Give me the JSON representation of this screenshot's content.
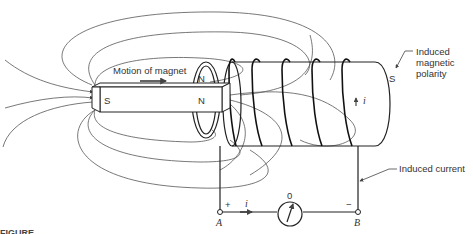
{
  "diagram": {
    "magnet": {
      "motion_label": "Motion of magnet",
      "south_pole": "S",
      "north_pole": "N"
    },
    "coil": {
      "near_end_pole": "N",
      "far_end_pole": "S",
      "current_symbol": "i"
    },
    "annotations": {
      "induced_polarity": [
        "Induced",
        "magnetic",
        "polarity"
      ],
      "induced_current": "Induced current"
    },
    "circuit": {
      "terminal_a": "A",
      "terminal_b": "B",
      "plus": "+",
      "minus": "−",
      "current_symbol": "i",
      "galvanometer_zero": "0"
    },
    "caption_fragment": "FIGURE"
  }
}
